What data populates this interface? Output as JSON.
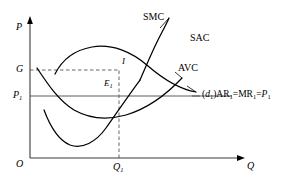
{
  "figure": {
    "type": "economics-cost-curve-diagram",
    "axes": {
      "y_label": "P",
      "x_label": "Q",
      "origin_label": "O"
    },
    "y_ticks": [
      {
        "label": "G",
        "sub": ""
      },
      {
        "label": "P",
        "sub": "1"
      }
    ],
    "x_ticks": [
      {
        "label": "Q",
        "sub": "1"
      }
    ],
    "curves": [
      {
        "name": "SMC",
        "label": "SMC"
      },
      {
        "name": "SAC",
        "label": "SAC"
      },
      {
        "name": "AVC",
        "label": "AVC"
      }
    ],
    "points": [
      {
        "name": "I",
        "label": "I"
      },
      {
        "name": "E1",
        "label": "E",
        "sub": "1"
      }
    ],
    "demand_line": {
      "prefix_open": "(",
      "d_symbol": "d",
      "d_sub": "1",
      "prefix_close": ")",
      "ar": "AR",
      "ar_sub": "1",
      "eq1": "=",
      "mr": "MR",
      "mr_sub": "1",
      "eq2": "=",
      "p": "P",
      "p_sub": "1"
    },
    "colors": {
      "stroke": "#000000",
      "axis": "#3a3a3a",
      "guide": "#555555",
      "background": "#ffffff"
    }
  }
}
